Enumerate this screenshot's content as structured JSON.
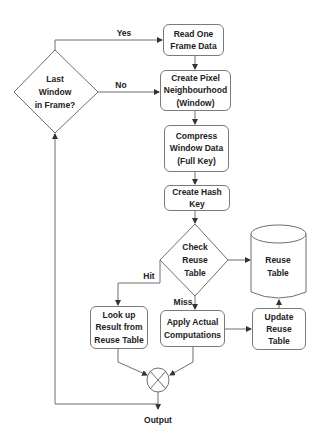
{
  "diagram": {
    "type": "flowchart",
    "nodes": {
      "last_window": {
        "shape": "diamond",
        "lines": [
          "Last",
          "Window",
          "in Frame?"
        ]
      },
      "read_frame": {
        "shape": "rounded-rect",
        "lines": [
          "Read One",
          "Frame Data"
        ]
      },
      "create_pixel": {
        "shape": "rounded-rect",
        "lines": [
          "Create Pixel",
          "Neighbourhood",
          "(Window)"
        ]
      },
      "compress": {
        "shape": "rounded-rect",
        "lines": [
          "Compress",
          "Window Data",
          "(Full Key)"
        ]
      },
      "hash_key": {
        "shape": "rounded-rect",
        "lines": [
          "Create Hash Key"
        ]
      },
      "check_reuse": {
        "shape": "diamond",
        "lines": [
          "Check",
          "Reuse",
          "Table"
        ]
      },
      "reuse_table": {
        "shape": "cylinder",
        "lines": [
          "Reuse",
          "Table"
        ]
      },
      "lookup": {
        "shape": "rounded-rect",
        "lines": [
          "Look up",
          "Result from",
          "Reuse Table"
        ]
      },
      "apply": {
        "shape": "rounded-rect",
        "lines": [
          "Apply Actual",
          "Computations"
        ]
      },
      "update": {
        "shape": "rounded-rect",
        "lines": [
          "Update",
          "Reuse",
          "Table"
        ]
      },
      "merge": {
        "shape": "circle-x",
        "lines": []
      }
    },
    "edge_labels": {
      "yes": "Yes",
      "no": "No",
      "hit": "Hit",
      "miss": "Miss",
      "output": "Output"
    },
    "edges": [
      {
        "from": "last_window",
        "to": "read_frame",
        "label": "Yes"
      },
      {
        "from": "last_window",
        "to": "create_pixel",
        "label": "No"
      },
      {
        "from": "read_frame",
        "to": "create_pixel"
      },
      {
        "from": "create_pixel",
        "to": "compress"
      },
      {
        "from": "compress",
        "to": "hash_key"
      },
      {
        "from": "hash_key",
        "to": "check_reuse"
      },
      {
        "from": "check_reuse",
        "to": "reuse_table"
      },
      {
        "from": "check_reuse",
        "to": "lookup",
        "label": "Hit"
      },
      {
        "from": "check_reuse",
        "to": "apply",
        "label": "Miss"
      },
      {
        "from": "apply",
        "to": "update"
      },
      {
        "from": "update",
        "to": "reuse_table"
      },
      {
        "from": "lookup",
        "to": "merge"
      },
      {
        "from": "apply",
        "to": "merge"
      },
      {
        "from": "merge",
        "to": "output",
        "label": "Output"
      },
      {
        "from": "merge",
        "to": "last_window"
      }
    ],
    "colors": {
      "stroke": "#7a7a7a",
      "text": "#222222",
      "background": "#ffffff"
    }
  }
}
